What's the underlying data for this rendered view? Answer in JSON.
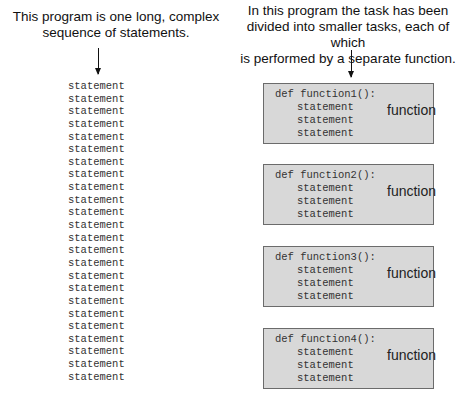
{
  "left": {
    "caption_line1": "This program is one long, complex",
    "caption_line2": "sequence of statements.",
    "statements": [
      "statement",
      "statement",
      "statement",
      "statement",
      "statement",
      "statement",
      "statement",
      "statement",
      "statement",
      "statement",
      "statement",
      "statement",
      "statement",
      "statement",
      "statement",
      "statement",
      "statement",
      "statement",
      "statement",
      "statement",
      "statement",
      "statement",
      "statement",
      "statement"
    ]
  },
  "right": {
    "caption_line1": "In this program the task has been",
    "caption_line2": "divided into smaller tasks, each of which",
    "caption_line3": "is performed by a separate function.",
    "functions": [
      {
        "def": "def function1():",
        "statements": [
          "statement",
          "statement",
          "statement"
        ],
        "label": "function"
      },
      {
        "def": "def function2():",
        "statements": [
          "statement",
          "statement",
          "statement"
        ],
        "label": "function"
      },
      {
        "def": "def function3():",
        "statements": [
          "statement",
          "statement",
          "statement"
        ],
        "label": "function"
      },
      {
        "def": "def function4():",
        "statements": [
          "statement",
          "statement",
          "statement"
        ],
        "label": "function"
      }
    ]
  },
  "colors": {
    "box_fill": "#d8d8d8",
    "box_border": "#6b6b6b",
    "text": "#333333"
  }
}
